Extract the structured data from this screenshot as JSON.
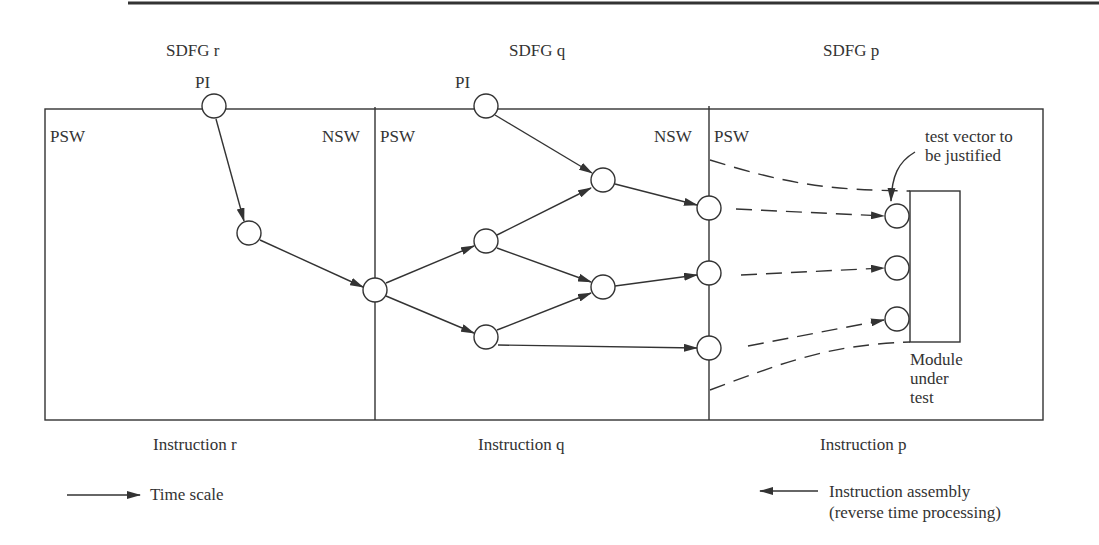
{
  "sdfg_labels": {
    "r": "SDFG  r",
    "q": "SDFG  q",
    "p": "SDFG  p"
  },
  "pi_labels": {
    "r": "PI",
    "q": "PI"
  },
  "window_labels": {
    "r_psw": "PSW",
    "r_nsw": "NSW",
    "q_psw": "PSW",
    "q_nsw": "NSW",
    "p_psw": "PSW"
  },
  "annotation": {
    "line1": "test vector to",
    "line2": "be justified"
  },
  "module": {
    "line1": "Module",
    "line2": "under",
    "line3": "test"
  },
  "instruction_labels": {
    "r": "Instruction  r",
    "q": "Instruction  q",
    "p": "Instruction  p"
  },
  "legend": {
    "time_scale": "Time scale",
    "assembly_line1": "Instruction assembly",
    "assembly_line2": "(reverse time processing)"
  },
  "colors": {
    "ink": "#333333",
    "background": "#ffffff"
  }
}
